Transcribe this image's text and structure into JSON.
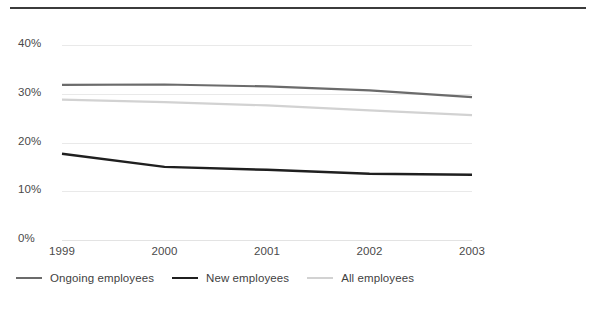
{
  "chart_data": {
    "type": "line",
    "title": "",
    "xlabel": "",
    "ylabel": "",
    "categories": [
      "1999",
      "2000",
      "2001",
      "2002",
      "2003"
    ],
    "x": [
      1999,
      2000,
      2001,
      2002,
      2003
    ],
    "ylim": [
      0,
      40
    ],
    "yticks": [
      0,
      10,
      20,
      30,
      40
    ],
    "ytick_labels": [
      "0%",
      "10%",
      "20%",
      "30%",
      "40%"
    ],
    "grid": true,
    "legend_position": "bottom-left",
    "value_suffix": "%",
    "series": [
      {
        "name": "Ongoing employees",
        "color": "#6b6b6b",
        "width": 2.2,
        "values": [
          31.8,
          31.9,
          31.5,
          30.7,
          29.3
        ]
      },
      {
        "name": "New employees",
        "color": "#1f1f1f",
        "width": 2.4,
        "values": [
          17.7,
          15.0,
          14.4,
          13.6,
          13.4
        ]
      },
      {
        "name": "All employees",
        "color": "#d2d2d2",
        "width": 2.2,
        "values": [
          28.8,
          28.3,
          27.6,
          26.6,
          25.6
        ]
      }
    ]
  },
  "decor": {
    "top_rule_color": "#3b3b3b",
    "gridline_color": "#e9e9e9",
    "axis_text_color": "#4a4a4a",
    "background": "#ffffff"
  },
  "footer": {
    "cutoff_text": ""
  }
}
